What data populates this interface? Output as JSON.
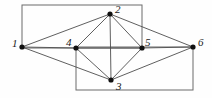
{
  "figure": {
    "kind": "undirected-graph-diagram",
    "width": 212,
    "height": 98,
    "background_color": "#fefefe",
    "edge_color": "#4d4d4d",
    "rect_color": "#6b6b6b",
    "node_color": "#111111",
    "label_color": "#1a1a1a",
    "node_radius": 2.6,
    "edge_width": 0.9,
    "rect_width": 1.0
  },
  "nodes": [
    {
      "id": "1",
      "label": "1",
      "x": 22,
      "y": 47,
      "label_x": 12,
      "label_y": 38
    },
    {
      "id": "2",
      "label": "2",
      "x": 110,
      "y": 14,
      "label_x": 115,
      "label_y": 4
    },
    {
      "id": "3",
      "label": "3",
      "x": 111,
      "y": 80,
      "label_x": 116,
      "label_y": 81
    },
    {
      "id": "4",
      "label": "4",
      "x": 76,
      "y": 48,
      "label_x": 66,
      "label_y": 37
    },
    {
      "id": "5",
      "label": "5",
      "x": 142,
      "y": 48,
      "label_x": 145,
      "label_y": 37
    },
    {
      "id": "6",
      "label": "6",
      "x": 193,
      "y": 47,
      "label_x": 198,
      "label_y": 37
    }
  ],
  "edges": [
    {
      "from": "1",
      "to": "2"
    },
    {
      "from": "1",
      "to": "4"
    },
    {
      "from": "1",
      "to": "3"
    },
    {
      "from": "2",
      "to": "4"
    },
    {
      "from": "2",
      "to": "3"
    },
    {
      "from": "2",
      "to": "5"
    },
    {
      "from": "2",
      "to": "6"
    },
    {
      "from": "3",
      "to": "4"
    },
    {
      "from": "3",
      "to": "5"
    },
    {
      "from": "3",
      "to": "6"
    },
    {
      "from": "4",
      "to": "5"
    },
    {
      "from": "5",
      "to": "6"
    }
  ],
  "rectangles": [
    {
      "name": "upper-rectangle",
      "x": 22,
      "y": 5,
      "width": 120,
      "height": 43
    },
    {
      "name": "lower-rectangle",
      "x": 76,
      "y": 47,
      "width": 117,
      "height": 43
    }
  ]
}
